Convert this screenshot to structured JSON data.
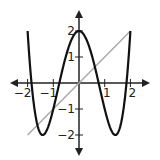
{
  "chart_data": {
    "type": "line",
    "title": "",
    "xlabel": "",
    "ylabel": "",
    "xlim": [
      -2.3,
      2.3
    ],
    "ylim": [
      -2.5,
      2.5
    ],
    "grid": false,
    "x_ticks": [
      "-2",
      "-1",
      "1",
      "2"
    ],
    "y_ticks": [
      "2",
      "1",
      "-1",
      "-2"
    ],
    "series": [
      {
        "name": "f(x) = x^4 - 4x^2 + 2",
        "color": "#111111",
        "domain": [
          -2,
          2
        ],
        "points": [
          [
            -2,
            2
          ],
          [
            -1.414,
            -2
          ],
          [
            0,
            2
          ],
          [
            1.414,
            -2
          ],
          [
            2,
            2
          ]
        ]
      },
      {
        "name": "y = x",
        "color": "#aaaaaa",
        "domain": [
          -2,
          2
        ],
        "points": [
          [
            -2,
            -2
          ],
          [
            2,
            2
          ]
        ]
      }
    ]
  }
}
